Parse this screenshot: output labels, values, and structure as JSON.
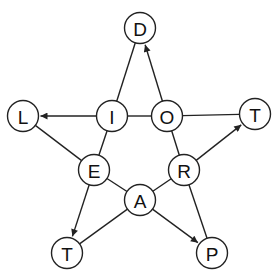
{
  "diagram": {
    "type": "directed-graph-star",
    "node_radius": 15.5,
    "colors": {
      "stroke": "#222222",
      "node_fill": "#ffffff",
      "text": "#111111",
      "background": "#ffffff"
    },
    "nodes": [
      {
        "id": "D",
        "label": "D",
        "x": 140,
        "y": 28
      },
      {
        "id": "L",
        "label": "L",
        "x": 23,
        "y": 116
      },
      {
        "id": "I",
        "label": "I",
        "x": 112,
        "y": 116
      },
      {
        "id": "O",
        "label": "O",
        "x": 167,
        "y": 116
      },
      {
        "id": "T1",
        "label": "T",
        "x": 255,
        "y": 114
      },
      {
        "id": "E",
        "label": "E",
        "x": 94,
        "y": 170
      },
      {
        "id": "R",
        "label": "R",
        "x": 184,
        "y": 170
      },
      {
        "id": "A",
        "label": "A",
        "x": 140,
        "y": 200
      },
      {
        "id": "T2",
        "label": "T",
        "x": 67,
        "y": 253
      },
      {
        "id": "P",
        "label": "P",
        "x": 212,
        "y": 253
      }
    ],
    "edges": [
      {
        "from": "I",
        "to": "D",
        "directed": false
      },
      {
        "from": "O",
        "to": "D",
        "directed": true
      },
      {
        "from": "I",
        "to": "L",
        "directed": true
      },
      {
        "from": "I",
        "to": "O",
        "directed": false
      },
      {
        "from": "O",
        "to": "T1",
        "directed": false
      },
      {
        "from": "L",
        "to": "E",
        "directed": false
      },
      {
        "from": "I",
        "to": "E",
        "directed": false
      },
      {
        "from": "O",
        "to": "R",
        "directed": false
      },
      {
        "from": "R",
        "to": "T1",
        "directed": true
      },
      {
        "from": "E",
        "to": "A",
        "directed": false
      },
      {
        "from": "A",
        "to": "R",
        "directed": false
      },
      {
        "from": "E",
        "to": "T2",
        "directed": true
      },
      {
        "from": "A",
        "to": "T2",
        "directed": false
      },
      {
        "from": "A",
        "to": "P",
        "directed": true
      },
      {
        "from": "R",
        "to": "P",
        "directed": false
      }
    ]
  }
}
